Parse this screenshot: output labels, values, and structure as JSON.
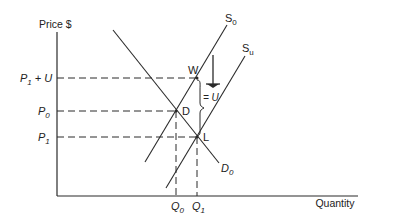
{
  "diagram": {
    "axes": {
      "y_label": "Price $",
      "x_label": "Quantity"
    },
    "price_levels": [
      {
        "label_main": "P",
        "label_sub": "1",
        "label_suffix": " + U",
        "y": 78
      },
      {
        "label_main": "P",
        "label_sub": "0",
        "label_suffix": "",
        "y": 111
      },
      {
        "label_main": "P",
        "label_sub": "1",
        "label_suffix": "",
        "y": 137
      }
    ],
    "quantity_levels": [
      {
        "label_main": "Q",
        "label_sub": "0",
        "x": 176
      },
      {
        "label_main": "Q",
        "label_sub": "1",
        "x": 197
      }
    ],
    "curves": {
      "supply_original": {
        "label_main": "S",
        "label_sub": "0"
      },
      "supply_shifted": {
        "label_main": "S",
        "label_sub": "u"
      },
      "demand": {
        "label_main": "D",
        "label_sub": "0"
      }
    },
    "points": {
      "W": "W",
      "D": "D",
      "L": "L"
    },
    "brace_label": "= U",
    "colors": {
      "line": "#2a2a2a",
      "background": "#ffffff"
    }
  }
}
